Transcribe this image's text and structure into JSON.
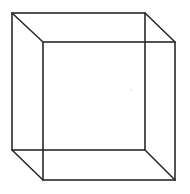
{
  "diagram": {
    "stroke_color": "#2a2a2a",
    "stroke_width": 1.6,
    "background": "#ffffff",
    "back_face": {
      "x1": 12,
      "y1": 13,
      "x2": 145,
      "y2": 150
    },
    "front_face": {
      "x1": 43,
      "y1": 42,
      "x2": 175,
      "y2": 180
    },
    "edges": [
      {
        "name": "top-left-edge",
        "x1": 12,
        "y1": 13,
        "x2": 43,
        "y2": 42
      },
      {
        "name": "top-right-edge",
        "x1": 145,
        "y1": 13,
        "x2": 175,
        "y2": 42
      },
      {
        "name": "bottom-left-edge",
        "x1": 12,
        "y1": 150,
        "x2": 43,
        "y2": 180
      },
      {
        "name": "bottom-right-edge",
        "x1": 145,
        "y1": 150,
        "x2": 175,
        "y2": 180
      }
    ],
    "artifact_dot": {
      "cx": 131,
      "cy": 90,
      "r": 0.8,
      "color": "#c8c8c8"
    }
  }
}
